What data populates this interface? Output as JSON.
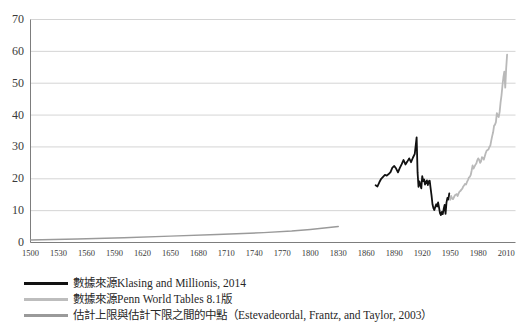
{
  "figure": {
    "background_color": "#ffffff",
    "plot": {
      "grid": true,
      "grid_color": "#c9c9c9",
      "axis_color": "#6e6e6e"
    }
  },
  "chart_data": {
    "type": "line",
    "title": "",
    "subtitle": "",
    "xlabel": "",
    "ylabel": "",
    "xlim": [
      1500,
      2020
    ],
    "ylim": [
      0,
      70
    ],
    "xticks": [
      1500,
      1530,
      1560,
      1590,
      1620,
      1650,
      1680,
      1710,
      1740,
      1770,
      1800,
      1830,
      1860,
      1890,
      1920,
      1950,
      1980,
      2010
    ],
    "yticks": [
      0,
      10,
      20,
      30,
      40,
      50,
      60,
      70
    ],
    "grid": true,
    "legend_position": "below",
    "series": [
      {
        "name": "數據來源Klasing and Millionis, 2014",
        "color": "#111111",
        "width": 1.8,
        "x": [
          1870,
          1872,
          1874,
          1876,
          1878,
          1880,
          1882,
          1884,
          1886,
          1888,
          1890,
          1892,
          1894,
          1896,
          1898,
          1900,
          1902,
          1904,
          1906,
          1908,
          1910,
          1912,
          1913,
          1914,
          1915,
          1916,
          1917,
          1918,
          1919,
          1920,
          1921,
          1922,
          1923,
          1924,
          1925,
          1926,
          1927,
          1928,
          1929,
          1930,
          1931,
          1932,
          1933,
          1934,
          1935,
          1936,
          1937,
          1938,
          1939,
          1940,
          1941,
          1942,
          1943,
          1944,
          1945,
          1946,
          1947,
          1948,
          1949
        ],
        "y": [
          18.0,
          17.6,
          18.9,
          20.0,
          20.6,
          21.2,
          21.0,
          21.5,
          22.1,
          23.5,
          24.0,
          23.2,
          22.0,
          23.4,
          24.6,
          25.9,
          24.5,
          25.4,
          26.4,
          25.2,
          26.6,
          27.8,
          30.4,
          33.0,
          22.0,
          17.5,
          19.2,
          18.0,
          17.0,
          20.8,
          19.3,
          19.8,
          18.2,
          19.0,
          19.5,
          18.0,
          19.2,
          19.4,
          17.0,
          14.7,
          12.0,
          10.8,
          10.2,
          11.2,
          12.0,
          11.3,
          12.6,
          11.0,
          9.2,
          8.6,
          9.6,
          8.9,
          10.5,
          11.8,
          9.0,
          12.5,
          14.0,
          13.5,
          15.4
        ]
      },
      {
        "name": "數據來源Penn World Tables 8.1版",
        "color": "#b9b9b9",
        "width": 1.8,
        "x": [
          1950,
          1951,
          1952,
          1953,
          1954,
          1955,
          1956,
          1957,
          1958,
          1959,
          1960,
          1961,
          1962,
          1963,
          1964,
          1965,
          1966,
          1967,
          1968,
          1969,
          1970,
          1971,
          1972,
          1973,
          1974,
          1975,
          1976,
          1977,
          1978,
          1979,
          1980,
          1981,
          1982,
          1983,
          1984,
          1985,
          1986,
          1987,
          1988,
          1989,
          1990,
          1991,
          1992,
          1993,
          1994,
          1995,
          1996,
          1997,
          1998,
          1999,
          2000,
          2001,
          2002,
          2003,
          2004,
          2005,
          2006,
          2007,
          2008,
          2009,
          2010,
          2011
        ],
        "y": [
          13.4,
          14.6,
          13.8,
          13.6,
          14.2,
          14.8,
          15.0,
          15.2,
          14.6,
          15.4,
          16.0,
          16.2,
          16.6,
          16.9,
          17.6,
          18.0,
          18.4,
          18.2,
          19.0,
          19.6,
          20.4,
          20.6,
          21.2,
          22.6,
          24.2,
          23.2,
          23.8,
          24.4,
          24.8,
          25.8,
          26.4,
          26.0,
          25.0,
          25.4,
          26.8,
          26.6,
          26.0,
          27.0,
          28.0,
          28.8,
          29.0,
          29.2,
          30.0,
          30.4,
          32.0,
          33.4,
          34.6,
          36.6,
          37.0,
          37.8,
          40.6,
          39.8,
          39.4,
          41.0,
          44.0,
          46.2,
          49.2,
          51.8,
          53.6,
          48.6,
          54.6,
          59.0
        ]
      },
      {
        "name": "估計上限與估計下限之間的中點（Estevadeordal, Frantz, and Taylor, 2003）",
        "color": "#9a9a9a",
        "width": 1.4,
        "x": [
          1500,
          1550,
          1600,
          1650,
          1700,
          1750,
          1780,
          1800,
          1820,
          1830
        ],
        "y": [
          0.8,
          1.1,
          1.5,
          2.0,
          2.5,
          3.1,
          3.6,
          4.1,
          4.7,
          5.0
        ]
      }
    ]
  },
  "legend": {
    "items": [
      {
        "label": "數據來源Klasing and Millionis, 2014",
        "color": "#111111"
      },
      {
        "label": "數據來源Penn World Tables 8.1版",
        "color": "#bdbdbd"
      },
      {
        "label": "估計上限與估計下限之間的中點（Estevadeordal, Frantz, and Taylor, 2003）",
        "color": "#9a9a9a"
      }
    ]
  },
  "axes": {
    "y_labels": [
      "70",
      "60",
      "50",
      "40",
      "30",
      "20",
      "10",
      "0"
    ],
    "x_labels": [
      "1500",
      "1530",
      "1560",
      "1590",
      "1620",
      "1650",
      "1680",
      "1710",
      "1740",
      "1770",
      "1800",
      "1830",
      "1860",
      "1890",
      "1920",
      "1950",
      "1980",
      "2010"
    ]
  }
}
